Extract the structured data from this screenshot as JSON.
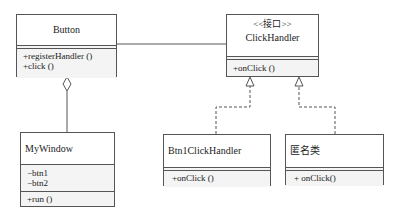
{
  "diagram": {
    "type": "uml-class-diagram",
    "classes": {
      "button": {
        "name": "Button",
        "attributes": [],
        "methods": [
          "+registerHandler ()",
          "+click ()"
        ]
      },
      "click_handler": {
        "stereotype": "<<接口>>",
        "name": "ClickHandler",
        "methods": [
          "+onClick ()"
        ]
      },
      "my_window": {
        "name": "MyWindow",
        "attributes": [
          "−btn1",
          "−btn2"
        ],
        "methods": [
          "+run ()"
        ]
      },
      "btn1_click_handler": {
        "name": "Btn1ClickHandler",
        "methods": [
          "+onClick ()"
        ]
      },
      "anonymous_class": {
        "name": "匿名类",
        "methods": [
          "+ onClick()"
        ]
      }
    },
    "relationships": [
      {
        "type": "association",
        "from": "Button",
        "to": "ClickHandler"
      },
      {
        "type": "aggregation",
        "whole": "Button",
        "part": "MyWindow"
      },
      {
        "type": "realization",
        "from": "Btn1ClickHandler",
        "to": "ClickHandler"
      },
      {
        "type": "realization",
        "from": "匿名类",
        "to": "ClickHandler"
      }
    ],
    "colors": {
      "line": "#555555",
      "section_fill": "#f4f4f4",
      "background": "#ffffff"
    }
  }
}
